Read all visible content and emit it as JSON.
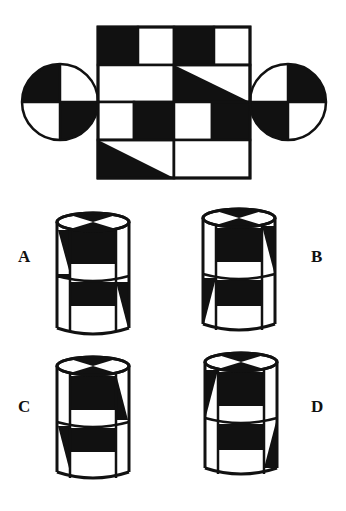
{
  "puzzle": {
    "description": "Cylinder net folding puzzle",
    "net": {
      "rows": 4,
      "cols": 4,
      "fill_color": "#111111",
      "line_color": "#111111",
      "background": "#ffffff"
    },
    "options": [
      {
        "letter": "A",
        "label": "A"
      },
      {
        "letter": "B",
        "label": "B"
      },
      {
        "letter": "C",
        "label": "C"
      },
      {
        "letter": "D",
        "label": "D"
      }
    ]
  }
}
